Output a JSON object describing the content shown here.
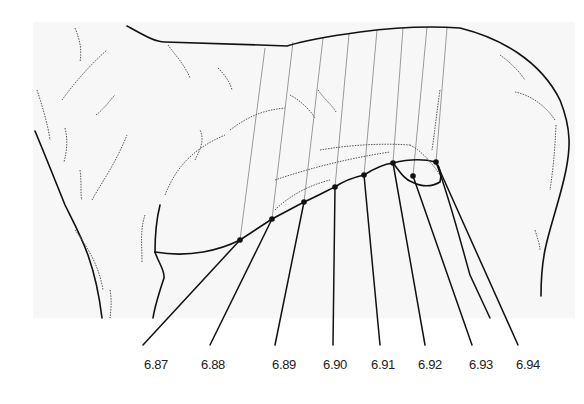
{
  "figure": {
    "colors": {
      "ink": "#111111",
      "guide_lines": "#9a9a9a",
      "hatching": "#555555",
      "panel": "#f7f7f7"
    },
    "labels": [
      {
        "text": "6.87",
        "x": 156,
        "point": [
          240,
          240
        ]
      },
      {
        "text": "6.88",
        "x": 213,
        "point": [
          272,
          219
        ]
      },
      {
        "text": "6.89",
        "x": 284,
        "point": [
          304,
          202
        ]
      },
      {
        "text": "6.90",
        "x": 335,
        "point": [
          335,
          187
        ]
      },
      {
        "text": "6.91",
        "x": 383,
        "point": [
          364,
          175
        ]
      },
      {
        "text": "6.92",
        "x": 430,
        "point": [
          393,
          163
        ]
      },
      {
        "text": "6.93",
        "x": 481,
        "point": [
          413,
          176
        ]
      },
      {
        "text": "6.94",
        "x": 528,
        "point": [
          436,
          162
        ]
      }
    ]
  }
}
